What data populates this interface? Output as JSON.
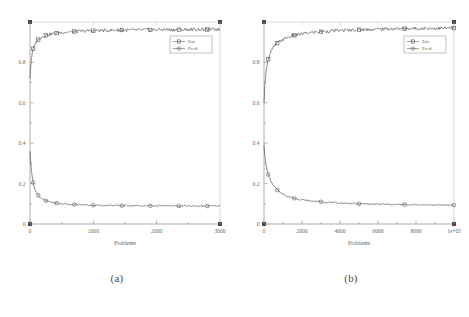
{
  "figure": {
    "panels": [
      {
        "caption": "(a)",
        "name": "panel-a",
        "chart": {
          "type": "line",
          "title": "",
          "xlabel": "Problems",
          "ylabel": "",
          "xlim": [
            0,
            3000
          ],
          "ylim": [
            0,
            1.0
          ],
          "xticks": [
            0,
            1000,
            2000,
            3000
          ],
          "xticklabels": [
            "0",
            "1000",
            "2000",
            "3000"
          ],
          "yticks": [
            0,
            0.2,
            0.4,
            0.6,
            0.8
          ],
          "yticklabels": [
            "0",
            "0.2",
            "0.4",
            "0.6",
            "0.8"
          ],
          "grid": false,
          "legend_position": "upper-right",
          "legend": [
            "Est.",
            "Pred."
          ],
          "series": [
            {
              "name": "Est.",
              "marker": "square",
              "x": [
                0,
                15,
                30,
                50,
                75,
                100,
                130,
                160,
                200,
                250,
                300,
                360,
                420,
                500,
                600,
                700,
                800,
                900,
                1000,
                1150,
                1300,
                1450,
                1600,
                1750,
                1900,
                2050,
                2200,
                2350,
                2500,
                2650,
                2800,
                3000
              ],
              "y": [
                0.72,
                0.795,
                0.838,
                0.868,
                0.889,
                0.902,
                0.913,
                0.921,
                0.928,
                0.934,
                0.938,
                0.942,
                0.945,
                0.948,
                0.951,
                0.953,
                0.954,
                0.956,
                0.957,
                0.958,
                0.959,
                0.96,
                0.96,
                0.961,
                0.961,
                0.962,
                0.962,
                0.962,
                0.963,
                0.963,
                0.963,
                0.964
              ]
            },
            {
              "name": "Pred.",
              "marker": "circle",
              "x": [
                0,
                15,
                30,
                50,
                75,
                100,
                130,
                160,
                200,
                250,
                300,
                360,
                420,
                500,
                600,
                700,
                800,
                900,
                1000,
                1150,
                1300,
                1450,
                1600,
                1750,
                1900,
                2050,
                2200,
                2350,
                2500,
                2650,
                2800,
                3000
              ],
              "y": [
                0.36,
                0.29,
                0.245,
                0.205,
                0.175,
                0.157,
                0.142,
                0.132,
                0.123,
                0.115,
                0.11,
                0.106,
                0.103,
                0.1,
                0.098,
                0.096,
                0.095,
                0.094,
                0.093,
                0.092,
                0.092,
                0.091,
                0.091,
                0.09,
                0.09,
                0.09,
                0.09,
                0.089,
                0.089,
                0.089,
                0.089,
                0.089
              ]
            }
          ]
        }
      },
      {
        "caption": "(b)",
        "name": "panel-b",
        "chart": {
          "type": "line",
          "title": "",
          "xlabel": "Problems",
          "ylabel": "",
          "xlim": [
            0,
            100000
          ],
          "ylim": [
            0,
            1.0
          ],
          "xticks": [
            0,
            20000,
            40000,
            60000,
            80000,
            100000
          ],
          "xticklabels": [
            "0",
            "2000",
            "4000",
            "6000",
            "8000",
            "1e+05"
          ],
          "yticks": [
            0,
            0.2,
            0.4,
            0.6,
            0.8
          ],
          "yticklabels": [
            "0",
            "0.2",
            "0.4",
            "0.6",
            "0.8"
          ],
          "grid": false,
          "legend_position": "upper-right",
          "legend": [
            "Est.",
            "Pred."
          ],
          "series": [
            {
              "name": "Est.",
              "marker": "square",
              "x": [
                0,
                500,
                1200,
                2200,
                3500,
                5000,
                7000,
                9500,
                12500,
                16000,
                20000,
                25000,
                30000,
                36000,
                42000,
                50000,
                58000,
                66000,
                74000,
                82000,
                90000,
                100000
              ],
              "y": [
                0.6,
                0.7,
                0.765,
                0.815,
                0.85,
                0.875,
                0.895,
                0.912,
                0.924,
                0.934,
                0.941,
                0.948,
                0.952,
                0.956,
                0.959,
                0.962,
                0.964,
                0.966,
                0.967,
                0.968,
                0.969,
                0.97
              ]
            },
            {
              "name": "Pred.",
              "marker": "circle",
              "x": [
                0,
                500,
                1200,
                2200,
                3500,
                5000,
                7000,
                9500,
                12500,
                16000,
                20000,
                25000,
                30000,
                36000,
                42000,
                50000,
                58000,
                66000,
                74000,
                82000,
                90000,
                100000
              ],
              "y": [
                0.39,
                0.33,
                0.285,
                0.245,
                0.213,
                0.19,
                0.168,
                0.15,
                0.137,
                0.127,
                0.12,
                0.114,
                0.11,
                0.106,
                0.103,
                0.1,
                0.098,
                0.097,
                0.096,
                0.095,
                0.094,
                0.094
              ]
            }
          ]
        }
      }
    ]
  }
}
